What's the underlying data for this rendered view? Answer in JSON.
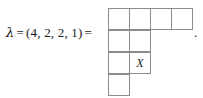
{
  "figure": {
    "equation": {
      "lambda_symbol": "λ",
      "equals_first": "=",
      "partition_text": "(4, 2, 2, 1)",
      "equals_second": "=",
      "full_text": "λ = (4, 2, 2, 1) ="
    },
    "trailing_punctuation": ".",
    "colors": {
      "grid_line": "#8c8c8c",
      "text": "#1a1a1a",
      "background": "#ffffff"
    }
  },
  "chart_data": {
    "type": "table",
    "categories": [
      "row 1",
      "row 2",
      "row 3",
      "row 4"
    ],
    "values": [
      4,
      2,
      2,
      1
    ],
    "xlabel": "",
    "ylabel": "",
    "partition": [
      4,
      2,
      2,
      1
    ],
    "total_cells": 9,
    "rows": [
      {
        "index": 1,
        "cells": [
          {
            "label": ""
          },
          {
            "label": ""
          },
          {
            "label": ""
          },
          {
            "label": ""
          }
        ]
      },
      {
        "index": 2,
        "cells": [
          {
            "label": ""
          },
          {
            "label": ""
          }
        ]
      },
      {
        "index": 3,
        "cells": [
          {
            "label": ""
          },
          {
            "label": "X"
          }
        ]
      },
      {
        "index": 4,
        "cells": [
          {
            "label": ""
          }
        ]
      }
    ],
    "annotations": [
      {
        "text": "X",
        "row": 3,
        "column": 2
      }
    ]
  }
}
